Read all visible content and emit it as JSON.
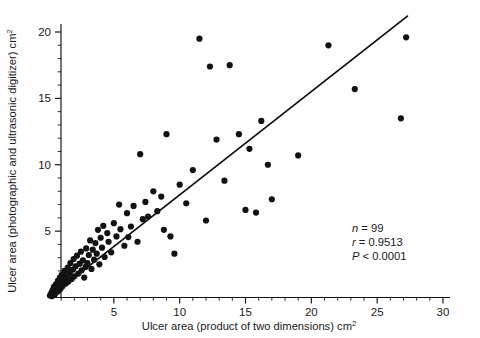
{
  "chart_data": {
    "type": "scatter",
    "title": "",
    "xlabel": "Ulcer area (product of two dimensions) cm²",
    "ylabel": "Ulcer area (photographic and ultrasonic digitizer) cm²",
    "xlabel_main": "Ulcer area (product of two dimensions) cm",
    "xlabel_sup": "2",
    "ylabel_main": "Ulcer area (photographic and ultrasonic digitizer) cm",
    "ylabel_sup": "2",
    "xlim": [
      0,
      30
    ],
    "ylim": [
      0,
      20.6
    ],
    "xticks": [
      5,
      10,
      15,
      20,
      25,
      30
    ],
    "xticklabels": [
      "5",
      "10",
      "15",
      "20",
      "25",
      "30"
    ],
    "yticks": [
      5,
      10,
      15,
      20
    ],
    "yticklabels": [
      "5",
      "10",
      "15",
      "20"
    ],
    "x_minor_step": 1,
    "y_minor_step": 1,
    "grid": false,
    "legend": null,
    "marker": "filled-circle",
    "marker_color": "#121212",
    "marker_size_px": 3.1,
    "n_points": 99,
    "points": [
      [
        0.15,
        0.15
      ],
      [
        0.25,
        0.35
      ],
      [
        0.3,
        0.1
      ],
      [
        0.35,
        0.55
      ],
      [
        0.4,
        0.3
      ],
      [
        0.45,
        0.8
      ],
      [
        0.5,
        0.2
      ],
      [
        0.55,
        0.6
      ],
      [
        0.6,
        1.0
      ],
      [
        0.65,
        0.4
      ],
      [
        0.7,
        0.75
      ],
      [
        0.75,
        1.25
      ],
      [
        0.8,
        0.5
      ],
      [
        0.85,
        0.95
      ],
      [
        0.9,
        1.5
      ],
      [
        0.95,
        0.65
      ],
      [
        1.0,
        1.1
      ],
      [
        1.05,
        1.7
      ],
      [
        1.1,
        0.85
      ],
      [
        1.2,
        1.35
      ],
      [
        1.25,
        2.0
      ],
      [
        1.35,
        1.05
      ],
      [
        1.4,
        1.6
      ],
      [
        1.5,
        2.25
      ],
      [
        1.55,
        1.2
      ],
      [
        1.65,
        1.85
      ],
      [
        1.7,
        2.6
      ],
      [
        1.8,
        1.4
      ],
      [
        1.9,
        2.1
      ],
      [
        1.95,
        2.9
      ],
      [
        2.0,
        1.6
      ],
      [
        2.1,
        2.35
      ],
      [
        2.2,
        3.15
      ],
      [
        2.3,
        1.8
      ],
      [
        2.4,
        2.55
      ],
      [
        2.5,
        3.45
      ],
      [
        2.55,
        2.05
      ],
      [
        2.65,
        2.8
      ],
      [
        2.75,
        1.5
      ],
      [
        2.85,
        2.3
      ],
      [
        2.9,
        3.7
      ],
      [
        3.0,
        2.6
      ],
      [
        3.1,
        3.2
      ],
      [
        3.2,
        4.3
      ],
      [
        3.3,
        2.15
      ],
      [
        3.4,
        3.6
      ],
      [
        3.5,
        2.85
      ],
      [
        3.6,
        4.1
      ],
      [
        3.7,
        3.3
      ],
      [
        3.8,
        5.1
      ],
      [
        3.9,
        2.5
      ],
      [
        4.0,
        4.5
      ],
      [
        4.1,
        3.75
      ],
      [
        4.2,
        5.4
      ],
      [
        4.3,
        3.05
      ],
      [
        4.5,
        4.85
      ],
      [
        4.6,
        4.2
      ],
      [
        4.8,
        3.4
      ],
      [
        5.0,
        5.6
      ],
      [
        5.2,
        4.6
      ],
      [
        5.4,
        7.0
      ],
      [
        5.5,
        5.15
      ],
      [
        5.8,
        3.9
      ],
      [
        6.0,
        6.35
      ],
      [
        6.1,
        4.55
      ],
      [
        6.3,
        5.35
      ],
      [
        6.5,
        6.9
      ],
      [
        6.8,
        4.2
      ],
      [
        7.0,
        10.8
      ],
      [
        7.2,
        5.9
      ],
      [
        7.4,
        7.2
      ],
      [
        7.6,
        6.1
      ],
      [
        8.0,
        8.0
      ],
      [
        8.3,
        6.5
      ],
      [
        8.6,
        7.6
      ],
      [
        8.8,
        5.1
      ],
      [
        9.0,
        12.3
      ],
      [
        9.3,
        4.6
      ],
      [
        9.6,
        3.3
      ],
      [
        10.0,
        8.5
      ],
      [
        10.5,
        7.1
      ],
      [
        11.0,
        9.6
      ],
      [
        11.5,
        19.5
      ],
      [
        12.0,
        5.8
      ],
      [
        12.3,
        17.4
      ],
      [
        12.8,
        11.9
      ],
      [
        13.4,
        8.8
      ],
      [
        13.8,
        17.5
      ],
      [
        14.5,
        12.3
      ],
      [
        15.0,
        6.6
      ],
      [
        15.3,
        11.2
      ],
      [
        15.8,
        6.4
      ],
      [
        16.2,
        13.3
      ],
      [
        16.7,
        10.0
      ],
      [
        17.0,
        7.4
      ],
      [
        19.0,
        10.7
      ],
      [
        21.3,
        19.0
      ],
      [
        23.3,
        15.7
      ],
      [
        26.8,
        13.5
      ],
      [
        27.2,
        19.6
      ]
    ],
    "fit_line": {
      "x_start": 0.2,
      "y_start": 0.1,
      "x_end": 27.3,
      "y_end": 21.2
    },
    "annotations": [
      {
        "name": "n",
        "symbol": "n",
        "op": " = ",
        "value": "99"
      },
      {
        "name": "r",
        "symbol": "r",
        "op": " = ",
        "value": "0.9513"
      },
      {
        "name": "p",
        "symbol": "P",
        "op": " < ",
        "value": "0.0001"
      }
    ],
    "annotation_lines": [
      "n = 99",
      "r = 0.9513",
      "P < 0.0001"
    ]
  }
}
